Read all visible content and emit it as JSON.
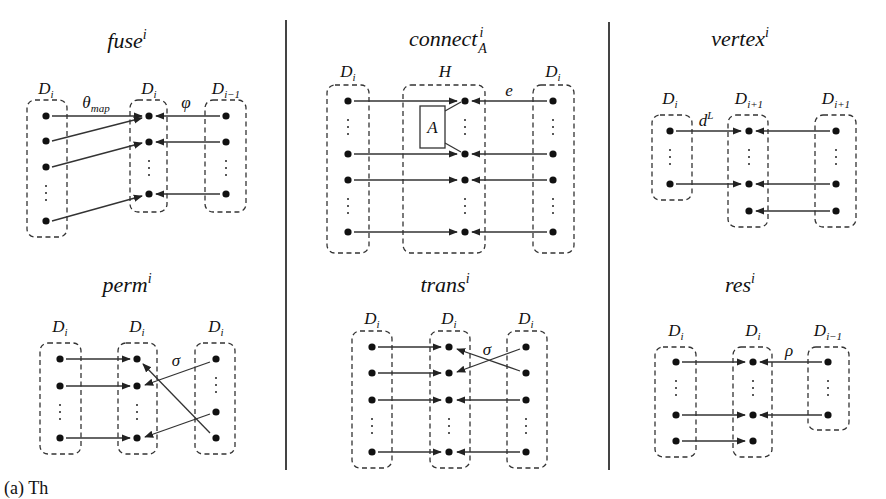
{
  "figure": {
    "caption_fragment": "(a) Th",
    "dividers_x": [
      286,
      609
    ],
    "panels": [
      {
        "id": "fuse",
        "title": "fuse",
        "title_sup": "i",
        "title_sub": "",
        "column_labels": [
          {
            "base": "D",
            "sub": "i"
          },
          {
            "base": "D",
            "sub": "i"
          },
          {
            "base": "D",
            "sub": "i−1"
          }
        ],
        "edge_labels": [
          {
            "base": "θ",
            "sub": "map"
          },
          {
            "base": "φ",
            "sub": ""
          }
        ]
      },
      {
        "id": "connect",
        "title": "connect",
        "title_sup": "i",
        "title_sub": "A",
        "column_labels": [
          {
            "base": "D",
            "sub": "i"
          },
          {
            "base": "H",
            "sub": ""
          },
          {
            "base": "D",
            "sub": "i"
          }
        ],
        "edge_labels": [
          {
            "base": "e",
            "sub": ""
          }
        ],
        "inner_box_label": "A"
      },
      {
        "id": "vertex",
        "title": "vertex",
        "title_sup": "i",
        "title_sub": "",
        "column_labels": [
          {
            "base": "D",
            "sub": "i"
          },
          {
            "base": "D",
            "sub": "i+1"
          },
          {
            "base": "D",
            "sub": "i+1"
          }
        ],
        "edge_labels": [
          {
            "base": "d",
            "sup": "L"
          }
        ]
      },
      {
        "id": "perm",
        "title": "perm",
        "title_sup": "i",
        "title_sub": "",
        "column_labels": [
          {
            "base": "D",
            "sub": "i"
          },
          {
            "base": "D",
            "sub": "i"
          },
          {
            "base": "D",
            "sub": "i"
          }
        ],
        "edge_labels": [
          {
            "base": "σ",
            "sub": ""
          }
        ]
      },
      {
        "id": "trans",
        "title": "trans",
        "title_sup": "i",
        "title_sub": "",
        "column_labels": [
          {
            "base": "D",
            "sub": "i"
          },
          {
            "base": "D",
            "sub": "i"
          },
          {
            "base": "D",
            "sub": "i"
          }
        ],
        "edge_labels": [
          {
            "base": "σ",
            "sub": ""
          }
        ]
      },
      {
        "id": "res",
        "title": "res",
        "title_sup": "i",
        "title_sub": "",
        "column_labels": [
          {
            "base": "D",
            "sub": "i"
          },
          {
            "base": "D",
            "sub": "i"
          },
          {
            "base": "D",
            "sub": "i−1"
          }
        ],
        "edge_labels": [
          {
            "base": "ρ",
            "sub": ""
          }
        ]
      }
    ]
  }
}
